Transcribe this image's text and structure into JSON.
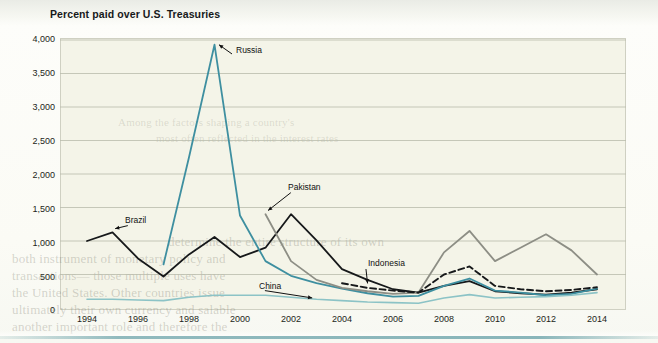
{
  "figure": {
    "title": "Percent paid over U.S. Treasuries"
  },
  "chart_data": {
    "type": "line",
    "title": "Percent paid over U.S. Treasuries",
    "xlabel": "",
    "ylabel": "Percent paid over U.S. Treasuries",
    "xlim": [
      1994,
      2014
    ],
    "ylim": [
      0,
      4000
    ],
    "grid": true,
    "legend_position": "inline-annotations",
    "x_ticks": [
      1994,
      1996,
      1998,
      2000,
      2002,
      2004,
      2006,
      2008,
      2010,
      2012,
      2014
    ],
    "x_tick_labels": [
      "1994",
      "1996",
      "1998",
      "2000",
      "2002",
      "2004",
      "2006",
      "2008",
      "2010",
      "2012",
      "2014"
    ],
    "y_ticks": [
      0,
      500,
      1000,
      1500,
      2000,
      2500,
      3000,
      3500,
      4000
    ],
    "y_tick_labels": [
      "0",
      "500",
      "1,000",
      "1,500",
      "2,000",
      "2,500",
      "3,000",
      "3,500",
      "4,000"
    ],
    "series": [
      {
        "name": "Brazil",
        "color": "#16181a",
        "style": "solid",
        "x": [
          1994,
          1995,
          1996,
          1997,
          1998,
          1999,
          2000,
          2001,
          2002,
          2003,
          2004,
          2005,
          2006,
          2007,
          2008,
          2009,
          2010,
          2011,
          2012,
          2013,
          2014
        ],
        "values": [
          1000,
          1130,
          740,
          470,
          800,
          1060,
          760,
          900,
          1400,
          1010,
          580,
          420,
          280,
          230,
          330,
          400,
          250,
          220,
          200,
          230,
          280
        ]
      },
      {
        "name": "Russia",
        "color": "#3e8fa0",
        "style": "solid",
        "x": [
          1997,
          1998,
          1999,
          2000,
          2001,
          2002,
          2003,
          2004,
          2005,
          2006,
          2007,
          2008,
          2009,
          2010,
          2011,
          2012,
          2013,
          2014
        ],
        "values": [
          650,
          2250,
          3930,
          1380,
          700,
          480,
          370,
          290,
          220,
          170,
          180,
          330,
          440,
          260,
          230,
          190,
          210,
          290
        ]
      },
      {
        "name": "Pakistan",
        "color": "#8d8e85",
        "style": "solid",
        "x": [
          2001,
          2002,
          2003,
          2004,
          2005,
          2006,
          2007,
          2008,
          2009,
          2010,
          2011,
          2012,
          2013,
          2014
        ],
        "values": [
          1400,
          700,
          420,
          300,
          250,
          210,
          230,
          830,
          1150,
          700,
          900,
          1100,
          860,
          500
        ]
      },
      {
        "name": "Indonesia",
        "color": "#16181a",
        "style": "dashed",
        "x": [
          2004,
          2005,
          2006,
          2007,
          2008,
          2009,
          2010,
          2011,
          2012,
          2013,
          2014
        ],
        "values": [
          370,
          300,
          260,
          230,
          500,
          620,
          330,
          280,
          250,
          270,
          310
        ]
      },
      {
        "name": "China",
        "color": "#8cc3c6",
        "style": "solid",
        "x": [
          1994,
          1995,
          1996,
          1997,
          1998,
          1999,
          2000,
          2001,
          2002,
          2003,
          2004,
          2005,
          2006,
          2007,
          2008,
          2009,
          2010,
          2011,
          2012,
          2013,
          2014
        ],
        "values": [
          130,
          130,
          120,
          110,
          160,
          190,
          190,
          190,
          160,
          130,
          110,
          90,
          80,
          70,
          150,
          200,
          150,
          160,
          170,
          190,
          230
        ]
      }
    ],
    "annotations": [
      {
        "label": "Brazil",
        "x": 1995,
        "text_x": 125,
        "text_y": 215
      },
      {
        "label": "Russia",
        "x": 1999,
        "text_x": 236,
        "text_y": 45
      },
      {
        "label": "Pakistan",
        "x": 2001,
        "text_x": 288,
        "text_y": 182
      },
      {
        "label": "Indonesia",
        "x": 2005,
        "text_x": 368,
        "text_y": 258
      },
      {
        "label": "China",
        "x": 2003,
        "text_x": 259,
        "text_y": 281
      }
    ]
  },
  "ghost_text": {
    "lines": [
      "determine the entire structure of its own",
      "both instrument of monetary policy and",
      "transactions— those multiple uses have",
      "the United States. Other countries issue",
      "ultimately their own currency and salable",
      "another important role and therefore the"
    ],
    "upper_lines": [
      "Among the factors shaping a country's",
      "most often reflected in the interest rates"
    ]
  }
}
